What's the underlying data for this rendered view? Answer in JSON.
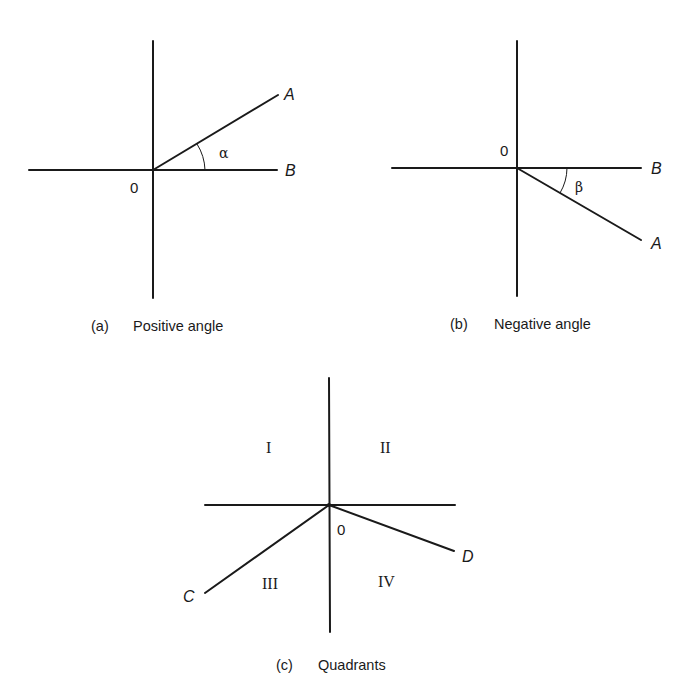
{
  "figures": [
    {
      "id": "a",
      "caption_tag": "(a)",
      "caption_text": "Positive angle",
      "origin_label": "0",
      "ray_labels": {
        "terminal": "A",
        "initial": "B"
      },
      "angle_label": "α"
    },
    {
      "id": "b",
      "caption_tag": "(b)",
      "caption_text": "Negative angle",
      "origin_label": "0",
      "ray_labels": {
        "terminal": "A",
        "initial": "B"
      },
      "angle_label": "β"
    },
    {
      "id": "c",
      "caption_tag": "(c)",
      "caption_text": "Quadrants",
      "origin_label": "0",
      "quadrants": [
        "I",
        "II",
        "III",
        "IV"
      ],
      "ray_labels": {
        "left": "C",
        "right": "D"
      }
    }
  ]
}
